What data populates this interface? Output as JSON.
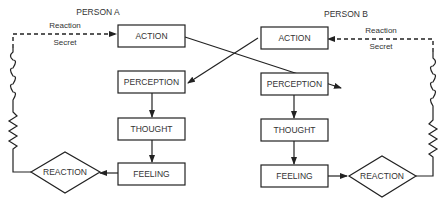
{
  "person_a": {
    "title": "PERSON A",
    "feedback_top": "Reaction",
    "feedback_bottom": "Secret",
    "nodes": {
      "action": "ACTION",
      "perception": "PERCEPTION",
      "thought": "THOUGHT",
      "feeling": "FEELING",
      "reaction": "REACTION"
    }
  },
  "person_b": {
    "title": "PERSON B",
    "feedback_top": "Reaction",
    "feedback_bottom": "Secret",
    "nodes": {
      "action": "ACTION",
      "perception": "PERCEPTION",
      "thought": "THOUGHT",
      "feeling": "FEELING",
      "reaction": "REACTION"
    }
  },
  "edges": [
    {
      "from": "A.action",
      "to": "B.perception"
    },
    {
      "from": "B.action",
      "to": "A.perception"
    },
    {
      "from": "A.perception",
      "to": "A.thought"
    },
    {
      "from": "A.thought",
      "to": "A.feeling"
    },
    {
      "from": "A.feeling",
      "to": "A.reaction"
    },
    {
      "from": "A.reaction",
      "to": "A.action",
      "style": "coil-zigzag-dashed"
    },
    {
      "from": "B.perception",
      "to": "B.thought"
    },
    {
      "from": "B.thought",
      "to": "B.feeling"
    },
    {
      "from": "B.feeling",
      "to": "B.reaction"
    },
    {
      "from": "B.reaction",
      "to": "B.action",
      "style": "coil-zigzag-dashed"
    }
  ]
}
